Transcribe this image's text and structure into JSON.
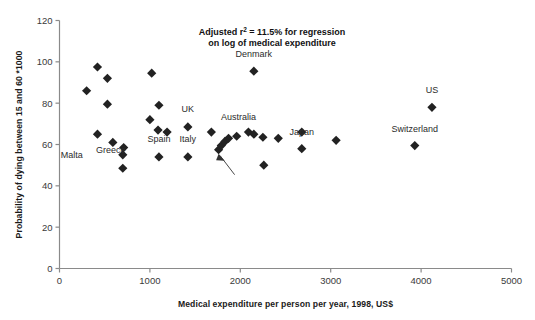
{
  "chart_data": {
    "type": "scatter",
    "title": "",
    "xlabel": "Medical expenditure per person per year, 1998, US$",
    "ylabel": "Probability of dying between 15 and 60 *1000",
    "xlim": [
      0,
      5000
    ],
    "ylim": [
      0,
      120
    ],
    "xticks": [
      0,
      1000,
      2000,
      3000,
      4000,
      5000
    ],
    "yticks": [
      0,
      20,
      40,
      60,
      80,
      100,
      120
    ],
    "xtick_labels": [
      "0",
      "1000",
      "2000",
      "3000",
      "4000",
      "5000"
    ],
    "ytick_labels": [
      "0",
      "20",
      "40",
      "60",
      "80",
      "100",
      "120"
    ],
    "grid": false,
    "legend": "none",
    "marker": "diamond",
    "marker_color": "#222222",
    "annotations": [
      {
        "name": "regression-note",
        "line1": "Adjusted r² = 11.5% for regression",
        "line2": "on log of medical expenditure",
        "x": 2350,
        "y": 113
      }
    ],
    "points": [
      {
        "label": "",
        "x": 300,
        "y": 86.0
      },
      {
        "label": "",
        "x": 420,
        "y": 97.5
      },
      {
        "label": "",
        "x": 530,
        "y": 92.0
      },
      {
        "label": "",
        "x": 530,
        "y": 79.5
      },
      {
        "label": "",
        "x": 420,
        "y": 65.0
      },
      {
        "label": "",
        "x": 590,
        "y": 61.0
      },
      {
        "label": "Malta",
        "x": 700,
        "y": 55.0
      },
      {
        "label": "Greece",
        "x": 700,
        "y": 48.5
      },
      {
        "label": "",
        "x": 710,
        "y": 58.5
      },
      {
        "label": "",
        "x": 1020,
        "y": 94.5
      },
      {
        "label": "",
        "x": 1100,
        "y": 79.0
      },
      {
        "label": "",
        "x": 1000,
        "y": 72.0
      },
      {
        "label": "",
        "x": 1090,
        "y": 67.0
      },
      {
        "label": "Spain",
        "x": 1100,
        "y": 54.0
      },
      {
        "label": "",
        "x": 1190,
        "y": 66.0
      },
      {
        "label": "UK",
        "x": 1420,
        "y": 68.5
      },
      {
        "label": "Italy",
        "x": 1420,
        "y": 54.0
      },
      {
        "label": "",
        "x": 1680,
        "y": 66.0
      },
      {
        "label": "Australia",
        "x": 1760,
        "y": 57.5
      },
      {
        "label": "",
        "x": 1790,
        "y": 59.5
      },
      {
        "label": "",
        "x": 1830,
        "y": 61.5
      },
      {
        "label": "",
        "x": 1870,
        "y": 63.0
      },
      {
        "label": "",
        "x": 1960,
        "y": 64.0
      },
      {
        "label": "Denmark",
        "x": 2150,
        "y": 95.5
      },
      {
        "label": "",
        "x": 2090,
        "y": 66.0
      },
      {
        "label": "",
        "x": 2150,
        "y": 65.0
      },
      {
        "label": "",
        "x": 2250,
        "y": 63.5
      },
      {
        "label": "",
        "x": 2260,
        "y": 50.0
      },
      {
        "label": "",
        "x": 2420,
        "y": 63.0
      },
      {
        "label": "Japan",
        "x": 2680,
        "y": 66.0
      },
      {
        "label": "",
        "x": 2680,
        "y": 58.0
      },
      {
        "label": "",
        "x": 3060,
        "y": 62.0
      },
      {
        "label": "Switzerland",
        "x": 3930,
        "y": 59.5
      },
      {
        "label": "US",
        "x": 4120,
        "y": 78.0
      }
    ],
    "point_labels": [
      {
        "text": "Malta",
        "x": 700,
        "y": 55.0,
        "dx": -40,
        "dy": 3,
        "anchor": "end"
      },
      {
        "text": "Greece",
        "x": 700,
        "y": 48.5,
        "dx": -12,
        "dy": -15,
        "anchor": "middle"
      },
      {
        "text": "Spain",
        "x": 1100,
        "y": 54.0,
        "dx": 0,
        "dy": -15,
        "anchor": "middle"
      },
      {
        "text": "UK",
        "x": 1420,
        "y": 68.5,
        "dx": 0,
        "dy": -15,
        "anchor": "middle"
      },
      {
        "text": "Italy",
        "x": 1420,
        "y": 54.0,
        "dx": 0,
        "dy": -15,
        "anchor": "middle"
      },
      {
        "text": "Australia",
        "x": 1760,
        "y": 57.5,
        "dx": 20,
        "dy": -30,
        "anchor": "middle"
      },
      {
        "text": "Denmark",
        "x": 2150,
        "y": 95.5,
        "dx": 0,
        "dy": -14,
        "anchor": "middle"
      },
      {
        "text": "Japan",
        "x": 2680,
        "y": 58.0,
        "dx": 0,
        "dy": -14,
        "anchor": "middle"
      },
      {
        "text": "Switzerland",
        "x": 3930,
        "y": 59.5,
        "dx": 0,
        "dy": -14,
        "anchor": "middle"
      },
      {
        "text": "US",
        "x": 4120,
        "y": 78.0,
        "dx": 0,
        "dy": -14,
        "anchor": "middle"
      }
    ]
  }
}
